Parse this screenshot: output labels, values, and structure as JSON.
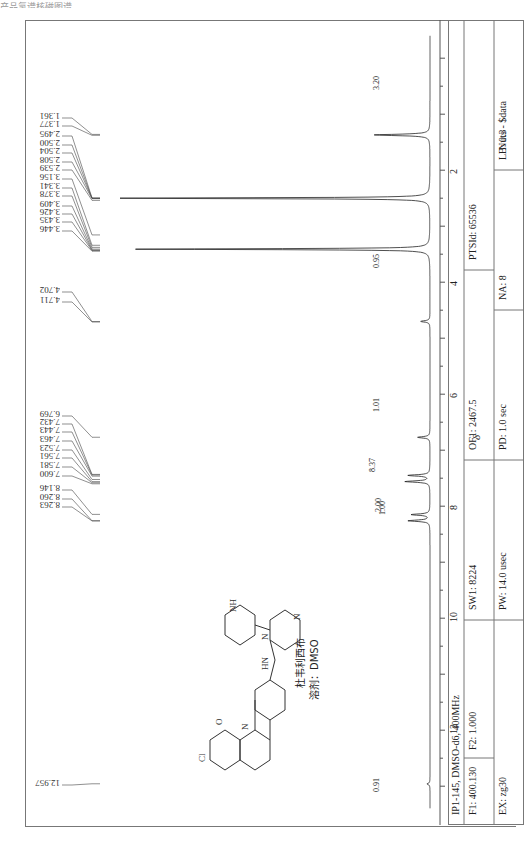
{
  "caption": "产品氢谱核磁图谱",
  "compound": {
    "name": "杜韦利西布",
    "solvent": "溶剂：DMSO"
  },
  "info_box": {
    "title": "IP1-145, DMSO-d6, 400MHz",
    "row1": [
      "F1: 400.130",
      "F2: 1.000",
      "SW1: 8224",
      "OF1: 2467.5",
      "PTSId: 65536"
    ],
    "row2": [
      "EX: zg30",
      "PW: 14.0 usec",
      "PD: 1.0 sec",
      "NA: 8",
      "LB: 0.3",
      "Nuts - $data"
    ]
  },
  "axis": {
    "label": "δ",
    "ticks": [
      "2",
      "4",
      "6",
      "8",
      "10",
      "12"
    ]
  },
  "chart_data": {
    "type": "line",
    "xlabel": "δ",
    "ylabel": "",
    "xlim": [
      13.5,
      -0.5
    ],
    "x_ticks": [
      2,
      4,
      6,
      8,
      10,
      12
    ],
    "peak_labels": [
      1.361,
      1.377,
      2.495,
      2.5,
      2.504,
      2.508,
      2.539,
      3.156,
      3.341,
      3.378,
      3.409,
      3.426,
      3.435,
      3.446,
      4.702,
      4.711,
      6.769,
      7.432,
      7.443,
      7.463,
      7.523,
      7.561,
      7.581,
      7.6,
      8.146,
      8.26,
      8.263,
      12.957
    ],
    "integrals": [
      {
        "ppm": 1.37,
        "value": 3.2
      },
      {
        "ppm": 4.7,
        "value": 0.95
      },
      {
        "ppm": 6.77,
        "value": 1.01
      },
      {
        "ppm": 7.52,
        "value": 8.37
      },
      {
        "ppm": 8.15,
        "value": 1.0
      },
      {
        "ppm": 8.26,
        "value": 2.0
      },
      {
        "ppm": 12.96,
        "value": 0.91
      }
    ],
    "major_peaks": [
      {
        "ppm": 1.37,
        "height": 0.18
      },
      {
        "ppm": 2.5,
        "height": 1.0
      },
      {
        "ppm": 3.41,
        "height": 0.95
      },
      {
        "ppm": 4.7,
        "height": 0.03
      },
      {
        "ppm": 6.77,
        "height": 0.04
      },
      {
        "ppm": 7.45,
        "height": 0.07
      },
      {
        "ppm": 7.56,
        "height": 0.08
      },
      {
        "ppm": 8.15,
        "height": 0.06
      },
      {
        "ppm": 8.26,
        "height": 0.07
      },
      {
        "ppm": 12.96,
        "height": 0.01
      }
    ]
  }
}
